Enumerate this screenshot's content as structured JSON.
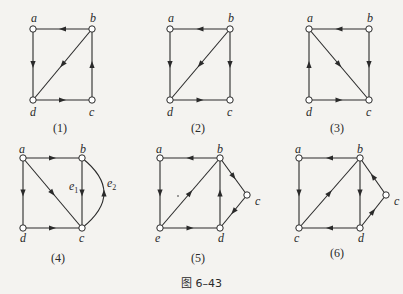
{
  "figure_caption": "图 6–43",
  "graphs": [
    {
      "caption": "(1)",
      "nodes": [
        {
          "id": "a",
          "x": 33,
          "y": 29,
          "lx": -2,
          "ly": -7
        },
        {
          "id": "b",
          "x": 92,
          "y": 29,
          "lx": -2,
          "ly": -7
        },
        {
          "id": "c",
          "x": 92,
          "y": 100,
          "lx": -3,
          "ly": 16
        },
        {
          "id": "d",
          "x": 33,
          "y": 100,
          "lx": -3,
          "ly": 16
        }
      ],
      "edges": [
        [
          "b",
          "a"
        ],
        [
          "a",
          "d"
        ],
        [
          "b",
          "d"
        ],
        [
          "d",
          "c"
        ],
        [
          "c",
          "b"
        ]
      ],
      "cap_x": 62,
      "cap_y": 132
    },
    {
      "caption": "(2)",
      "nodes": [
        {
          "id": "a",
          "x": 170,
          "y": 29,
          "lx": -2,
          "ly": -7
        },
        {
          "id": "b",
          "x": 230,
          "y": 29,
          "lx": -2,
          "ly": -7
        },
        {
          "id": "c",
          "x": 230,
          "y": 100,
          "lx": -3,
          "ly": 16
        },
        {
          "id": "d",
          "x": 170,
          "y": 100,
          "lx": -3,
          "ly": 16
        }
      ],
      "edges": [
        [
          "b",
          "a"
        ],
        [
          "a",
          "d"
        ],
        [
          "b",
          "d"
        ],
        [
          "b",
          "c"
        ],
        [
          "d",
          "c"
        ]
      ],
      "cap_x": 200,
      "cap_y": 132
    },
    {
      "caption": "(3)",
      "nodes": [
        {
          "id": "a",
          "x": 309,
          "y": 29,
          "lx": -2,
          "ly": -7
        },
        {
          "id": "b",
          "x": 369,
          "y": 29,
          "lx": -2,
          "ly": -7
        },
        {
          "id": "c",
          "x": 369,
          "y": 100,
          "lx": -3,
          "ly": 16
        },
        {
          "id": "d",
          "x": 309,
          "y": 100,
          "lx": -3,
          "ly": 16
        }
      ],
      "edges": [
        [
          "b",
          "a"
        ],
        [
          "d",
          "a"
        ],
        [
          "a",
          "c"
        ],
        [
          "b",
          "c"
        ],
        [
          "d",
          "c"
        ]
      ],
      "cap_x": 339,
      "cap_y": 132
    },
    {
      "caption": "(4)",
      "nodes": [
        {
          "id": "a",
          "x": 23,
          "y": 158,
          "lx": -4,
          "ly": -5
        },
        {
          "id": "b",
          "x": 82,
          "y": 158,
          "lx": -2,
          "ly": -5
        },
        {
          "id": "c",
          "x": 82,
          "y": 228,
          "lx": -3,
          "ly": 14
        },
        {
          "id": "d",
          "x": 23,
          "y": 228,
          "lx": -3,
          "ly": 14
        }
      ],
      "edges": [
        [
          "a",
          "b"
        ],
        [
          "a",
          "d"
        ],
        [
          "a",
          "c"
        ],
        [
          "b",
          "c"
        ],
        [
          "d",
          "c"
        ]
      ],
      "arcs": [
        {
          "from": "c",
          "to": "b",
          "cx": 118,
          "label": "e2"
        }
      ],
      "edge_labels": [
        {
          "text": "e",
          "sub": "1",
          "x": 69,
          "y": 190
        },
        {
          "text": "e",
          "sub": "2",
          "x": 107,
          "y": 187
        }
      ],
      "cap_x": 60,
      "cap_y": 262
    },
    {
      "caption": "(5)",
      "nodes": [
        {
          "id": "a",
          "x": 160,
          "y": 158,
          "lx": -4,
          "ly": -5
        },
        {
          "id": "b",
          "x": 220,
          "y": 158,
          "lx": -3,
          "ly": -5
        },
        {
          "id": "c",
          "x": 247,
          "y": 195,
          "lx": 8,
          "ly": 10
        },
        {
          "id": "d",
          "x": 220,
          "y": 228,
          "lx": -2,
          "ly": 14
        },
        {
          "id": "e",
          "x": 160,
          "y": 228,
          "lx": -5,
          "ly": 14
        }
      ],
      "edges": [
        [
          "b",
          "a"
        ],
        [
          "a",
          "e"
        ],
        [
          "e",
          "b"
        ],
        [
          "e",
          "d"
        ],
        [
          "d",
          "b"
        ],
        [
          "b",
          "c"
        ],
        [
          "c",
          "d"
        ]
      ],
      "cap_x": 200,
      "cap_y": 262
    },
    {
      "caption": "(6)",
      "nodes": [
        {
          "id": "a",
          "x": 299,
          "y": 158,
          "lx": -4,
          "ly": -5
        },
        {
          "id": "b",
          "x": 360,
          "y": 158,
          "lx": -3,
          "ly": -5
        },
        {
          "id": "c2",
          "label": "c",
          "x": 386,
          "y": 195,
          "lx": 8,
          "ly": 10
        },
        {
          "id": "d",
          "x": 360,
          "y": 228,
          "lx": -2,
          "ly": 14
        },
        {
          "id": "c",
          "x": 299,
          "y": 228,
          "lx": -5,
          "ly": 14
        }
      ],
      "edges": [
        [
          "b",
          "a"
        ],
        [
          "a",
          "c"
        ],
        [
          "c",
          "b"
        ],
        [
          "d",
          "c"
        ],
        [
          "b",
          "d"
        ],
        [
          "d",
          "c2"
        ],
        [
          "c2",
          "b"
        ]
      ],
      "cap_x": 339,
      "cap_y": 257
    }
  ],
  "colors": {
    "ink": "#2a2a2a",
    "paper": "#f4f3f0"
  },
  "stray_dot": {
    "x": 178,
    "y": 196
  }
}
